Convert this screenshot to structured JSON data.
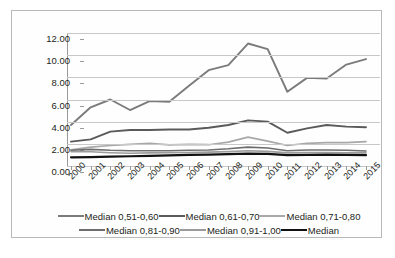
{
  "chart_data": {
    "type": "line",
    "title": "",
    "xlabel": "",
    "ylabel": "",
    "ylim": [
      0,
      12
    ],
    "ytick_step": 2,
    "ytick_labels": [
      "12.00",
      "10.00",
      "8.00",
      "6.00",
      "4.00",
      "2.00",
      "0.00"
    ],
    "ytick_values": [
      12,
      10,
      8,
      6,
      4,
      2,
      0
    ],
    "grid": true,
    "legend_position": "bottom",
    "categories": [
      "2000",
      "2001",
      "2002",
      "2003",
      "2004",
      "2005",
      "2006",
      "2007",
      "2008",
      "2009",
      "2010",
      "2011",
      "2012",
      "2013",
      "2014",
      "2015"
    ],
    "series": [
      {
        "name": "Median 0,51-0,60",
        "color": "#7b7b7b",
        "width": 1.9,
        "values": [
          3.7,
          5.3,
          6.0,
          5.05,
          5.85,
          5.8,
          7.25,
          8.65,
          9.1,
          11.05,
          10.55,
          6.7,
          7.95,
          7.9,
          9.15,
          9.65
        ]
      },
      {
        "name": "Median 0,61-0,70",
        "color": "#5a5a5a",
        "width": 1.9,
        "values": [
          2.2,
          2.4,
          3.1,
          3.25,
          3.25,
          3.3,
          3.3,
          3.45,
          3.7,
          4.12,
          4.0,
          3.0,
          3.4,
          3.7,
          3.55,
          3.5
        ]
      },
      {
        "name": "Median 0,71-0,80",
        "color": "#a8a8a8",
        "width": 1.7,
        "values": [
          1.45,
          1.7,
          1.85,
          1.95,
          2.05,
          1.9,
          1.95,
          1.92,
          2.15,
          2.6,
          2.25,
          1.85,
          2.05,
          2.1,
          2.1,
          2.2
        ]
      },
      {
        "name": "Median 0,81-0,90",
        "color": "#6e6e6e",
        "width": 1.6,
        "values": [
          1.42,
          1.5,
          1.42,
          1.38,
          1.38,
          1.38,
          1.42,
          1.45,
          1.55,
          1.7,
          1.62,
          1.38,
          1.45,
          1.45,
          1.42,
          1.35
        ]
      },
      {
        "name": "Median 0,91-1,00",
        "color": "#9b9b9b",
        "width": 1.6,
        "values": [
          1.3,
          1.28,
          1.2,
          1.15,
          1.18,
          1.2,
          1.22,
          1.25,
          1.3,
          1.38,
          1.32,
          1.18,
          1.22,
          1.22,
          1.2,
          1.18
        ]
      },
      {
        "name": "Median",
        "color": "#111111",
        "width": 2.2,
        "values": [
          0.78,
          0.8,
          0.85,
          0.88,
          0.92,
          0.95,
          1.0,
          1.02,
          1.08,
          1.12,
          1.1,
          0.98,
          1.0,
          1.02,
          1.0,
          0.98
        ]
      }
    ]
  },
  "legend": {
    "rows": [
      [
        {
          "label": "Median 0,51-0,60"
        },
        {
          "label": "Median 0,61-0,70"
        },
        {
          "label": "Median 0,71-0,80"
        }
      ],
      [
        {
          "label": "Median 0,81-0,90"
        },
        {
          "label": "Median 0,91-1,00"
        },
        {
          "label": "Median"
        }
      ]
    ]
  }
}
